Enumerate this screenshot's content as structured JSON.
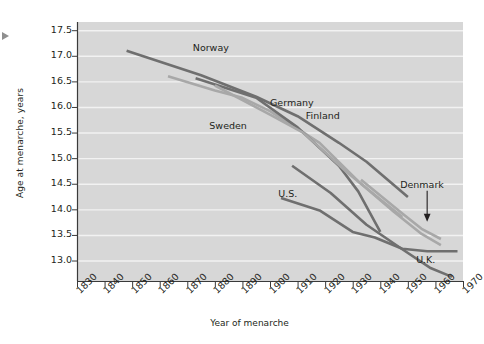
{
  "chart_data": {
    "type": "line",
    "title": "",
    "xlabel": "Year of menarche",
    "ylabel": "Age at menarche, years",
    "xlim": [
      1830,
      1970
    ],
    "ylim": [
      12.6,
      17.5
    ],
    "grid": true,
    "legend_position": "inline-labels",
    "xticks": [
      1830,
      1840,
      1850,
      1860,
      1870,
      1880,
      1890,
      1900,
      1910,
      1920,
      1930,
      1940,
      1950,
      1960,
      1970
    ],
    "yticks": [
      13.0,
      13.5,
      14.0,
      14.5,
      15.0,
      15.5,
      16.0,
      16.5,
      17.0,
      17.5
    ],
    "ytick_labels": [
      "13.0",
      "13.5",
      "14.0",
      "14.5",
      "15.0",
      "15.5",
      "16.0",
      "16.5",
      "17.0",
      "17.5"
    ],
    "xtick_labels": [
      "1830",
      "1840",
      "1850",
      "1860",
      "1870",
      "1880",
      "1890",
      "1900",
      "1910",
      "1920",
      "1930",
      "1940",
      "1950",
      "1960",
      "1970"
    ],
    "annotations": [
      {
        "text": "Denmark",
        "kind": "arrow-callout",
        "points_to_year": 1957,
        "points_to_age": 13.7
      }
    ],
    "series": [
      {
        "name": "Norway",
        "color": "#6f6f6f",
        "label_x": 1872,
        "label_y": 17.16,
        "x": [
          1848,
          1875,
          1895,
          1910,
          1925,
          1935,
          1950
        ],
        "y": [
          17.1,
          16.62,
          16.2,
          15.82,
          15.3,
          14.93,
          14.24
        ]
      },
      {
        "name": "Sweden",
        "color": "#a8a8a8",
        "label_x": 1878,
        "label_y": 15.62,
        "x": [
          1863,
          1880,
          1890,
          1900,
          1918,
          1932,
          1945,
          1955,
          1962
        ],
        "y": [
          16.6,
          16.32,
          16.18,
          15.92,
          15.3,
          14.55,
          13.95,
          13.52,
          13.3
        ]
      },
      {
        "name": "Germany",
        "color": "#6f6f6f",
        "label_x": 1900,
        "label_y": 16.08,
        "x": [
          1873,
          1895,
          1910,
          1925,
          1932,
          1940
        ],
        "y": [
          16.56,
          16.18,
          15.6,
          14.85,
          14.35,
          13.56
        ]
      },
      {
        "name": "Finland",
        "color": "#a8a8a8",
        "label_x": 1913,
        "label_y": 15.82,
        "x": [
          1880,
          1900,
          1912,
          1928,
          1938,
          1948
        ],
        "y": [
          16.42,
          15.85,
          15.5,
          14.72,
          14.28,
          13.85
        ]
      },
      {
        "name": "U.S.",
        "color": "#6f6f6f",
        "label_x": 1903,
        "label_y": 14.3,
        "x": [
          1904,
          1918,
          1930,
          1938,
          1948,
          1957,
          1968
        ],
        "y": [
          14.22,
          13.98,
          13.56,
          13.45,
          13.23,
          13.18,
          13.18
        ]
      },
      {
        "name": "Denmark",
        "color": "#a8a8a8",
        "label_x": 1944,
        "label_y": 14.42,
        "x": [
          1933,
          1948,
          1955,
          1962
        ],
        "y": [
          14.58,
          13.92,
          13.62,
          13.42
        ]
      },
      {
        "name": "U.K.",
        "color": "#6f6f6f",
        "label_x": 1953,
        "label_y": 13.02,
        "x": [
          1908,
          1922,
          1935,
          1948,
          1958,
          1966
        ],
        "y": [
          14.85,
          14.32,
          13.7,
          13.22,
          12.86,
          12.68
        ]
      }
    ]
  }
}
